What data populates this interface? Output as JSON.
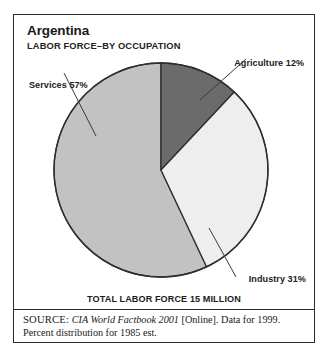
{
  "figure": {
    "title": "Argentina",
    "subtitle": "LABOR FORCE–BY OCCUPATION",
    "total_caption": "TOTAL LABOR FORCE 15 MILLION",
    "frame_color": "#2a2a2a",
    "background": "#ffffff"
  },
  "chart_data": {
    "type": "pie",
    "title": "Argentina",
    "subtitle": "LABOR FORCE–BY OCCUPATION",
    "xlabel": "",
    "ylabel": "",
    "units": "percent",
    "total_label": "TOTAL LABOR FORCE 15 MILLION",
    "total_value": 15,
    "total_units": "million workers",
    "start_angle_deg": 0,
    "direction": "clockwise",
    "legend": "none (direct labels with leader lines)",
    "grid": false,
    "categories": [
      "Agriculture",
      "Industry",
      "Services"
    ],
    "values": [
      12,
      31,
      57
    ],
    "labels": [
      "Agriculture 12%",
      "Industry 31%",
      "Services 57%"
    ],
    "colors": [
      "#6b6b6b",
      "#eeeeee",
      "#c2c2c2"
    ],
    "slices": [
      {
        "name": "Agriculture",
        "value": 12,
        "label": "Agriculture 12%",
        "color": "#6b6b6b"
      },
      {
        "name": "Industry",
        "value": 31,
        "label": "Industry 31%",
        "color": "#eeeeee"
      },
      {
        "name": "Services",
        "value": 57,
        "label": "Services 57%",
        "color": "#c2c2c2"
      }
    ]
  },
  "source": {
    "prefix": "SOURCE:",
    "work": "CIA World Factbook 2001",
    "medium": "[Online]. Data for 1999.",
    "note": "Percent distribution for 1985 est."
  }
}
